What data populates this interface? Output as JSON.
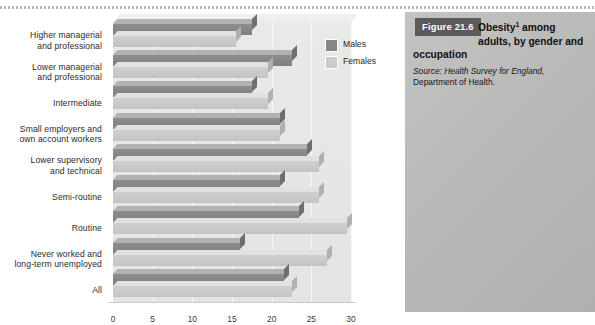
{
  "figure": {
    "tag": "Figure 21.6",
    "title_line1": "Obesity",
    "title_sup": "1",
    "title_line1b": " among",
    "title_line2": "adults, by gender and",
    "title_line3": "occupation",
    "source_label": "Source:",
    "source_italic": " Health Survey for England,",
    "source_line2": "Department of Health."
  },
  "legend": {
    "items": [
      {
        "label": "Males",
        "color": "#868686"
      },
      {
        "label": "Females",
        "color": "#cbcbc9"
      }
    ]
  },
  "axis": {
    "ticks": [
      "0",
      "5",
      "10",
      "15",
      "20",
      "25",
      "30"
    ]
  },
  "footer": {
    "text": "…"
  },
  "chart_data": {
    "type": "bar",
    "orientation": "horizontal",
    "subtitle": "Source: Health Survey for England, Department of Health.",
    "xlabel": "",
    "ylabel": "",
    "xlim": [
      0,
      30
    ],
    "grid": true,
    "legend_position": "top-right",
    "categories": [
      "Higher managerial and professional",
      "Lower managerial and professional",
      "Intermediate",
      "Small employers and own account workers",
      "Lower supervisory and technical",
      "Semi-routine",
      "Routine",
      "Never worked and long-term unemployed",
      "All"
    ],
    "series": [
      {
        "name": "Males",
        "color": "#868686",
        "values": [
          17.5,
          22.5,
          17.5,
          21.0,
          24.5,
          21.0,
          23.5,
          16.0,
          21.5
        ]
      },
      {
        "name": "Females",
        "color": "#cbcbc9",
        "values": [
          15.5,
          19.5,
          19.5,
          21.0,
          26.0,
          26.0,
          29.5,
          27.0,
          22.5
        ]
      }
    ]
  }
}
